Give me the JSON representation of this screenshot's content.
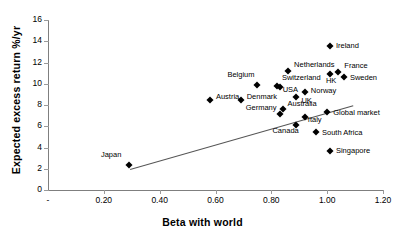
{
  "chart_data": {
    "type": "scatter",
    "title": "",
    "xlabel": "Beta with world",
    "ylabel": "Expected excess return %/yr",
    "xlim": [
      0,
      1.2
    ],
    "ylim": [
      0,
      16
    ],
    "xticks": [
      "-",
      "0.20",
      "0.40",
      "0.60",
      "0.80",
      "1.00",
      "1.20"
    ],
    "xtick_values": [
      0,
      0.2,
      0.4,
      0.6,
      0.8,
      1.0,
      1.2
    ],
    "yticks": [
      "0",
      "2",
      "4",
      "6",
      "8",
      "10",
      "12",
      "14",
      "16"
    ],
    "ytick_values": [
      0,
      2,
      4,
      6,
      8,
      10,
      12,
      14,
      16
    ],
    "grid": false,
    "legend": "none",
    "marker_style": "black-diamond",
    "points": [
      {
        "label": "Japan",
        "x": 0.29,
        "y": 2.4,
        "label_dx": -28,
        "label_dy": -10
      },
      {
        "label": "Austria",
        "x": 0.58,
        "y": 8.5,
        "label_dx": 6,
        "label_dy": -3
      },
      {
        "label": "Denmark",
        "x": 0.69,
        "y": 8.5,
        "label_dx": 6,
        "label_dy": -3
      },
      {
        "label": "Belgium",
        "x": 0.75,
        "y": 9.9,
        "label_dx": -30,
        "label_dy": -10
      },
      {
        "label": "Switzerland",
        "x": 0.82,
        "y": 9.8,
        "label_dx": 5,
        "label_dy": -8
      },
      {
        "label": "USA",
        "x": 0.83,
        "y": 9.7,
        "label_dx": 3,
        "label_dy": 3
      },
      {
        "label": "Netherlands",
        "x": 0.86,
        "y": 11.2,
        "label_dx": 6,
        "label_dy": -6
      },
      {
        "label": "UK",
        "x": 0.89,
        "y": 8.8,
        "label_dx": 5,
        "label_dy": 4
      },
      {
        "label": "Norway",
        "x": 0.92,
        "y": 9.2,
        "label_dx": 6,
        "label_dy": -1
      },
      {
        "label": "Germany",
        "x": 0.83,
        "y": 7.2,
        "label_dx": -34,
        "label_dy": -6
      },
      {
        "label": "Australia",
        "x": 0.84,
        "y": 7.6,
        "label_dx": 5,
        "label_dy": -5
      },
      {
        "label": "Canada",
        "x": 0.89,
        "y": 6.1,
        "label_dx": -24,
        "label_dy": 6
      },
      {
        "label": "Italy",
        "x": 0.92,
        "y": 6.9,
        "label_dx": 3,
        "label_dy": 3
      },
      {
        "label": "South  Africa",
        "x": 0.96,
        "y": 5.5,
        "label_dx": 6,
        "label_dy": 1
      },
      {
        "label": "Global market",
        "x": 1.0,
        "y": 7.3,
        "label_dx": 6,
        "label_dy": 1
      },
      {
        "label": "HK",
        "x": 1.01,
        "y": 10.9,
        "label_dx": -4,
        "label_dy": 7
      },
      {
        "label": "Ireland",
        "x": 1.01,
        "y": 13.6,
        "label_dx": 6,
        "label_dy": 0
      },
      {
        "label": "Singapore",
        "x": 1.01,
        "y": 3.7,
        "label_dx": 6,
        "label_dy": 0
      },
      {
        "label": "France",
        "x": 1.04,
        "y": 11.1,
        "label_dx": 6,
        "label_dy": -6
      },
      {
        "label": "Sweden",
        "x": 1.06,
        "y": 10.6,
        "label_dx": 6,
        "label_dy": 1
      }
    ],
    "trendline": {
      "x1": 0.295,
      "y1": 2.0,
      "x2": 1.095,
      "y2": 8.0
    }
  }
}
